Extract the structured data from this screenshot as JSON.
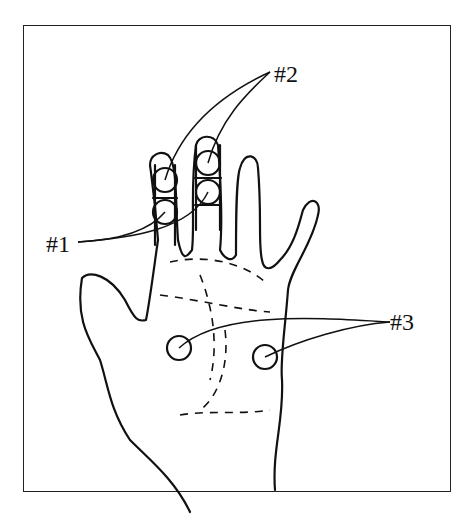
{
  "figure": {
    "type": "hand-diagram",
    "labels": [
      {
        "id": "label-1",
        "text": "#1",
        "x": 46,
        "y": 232
      },
      {
        "id": "label-2",
        "text": "#2",
        "x": 274,
        "y": 62
      },
      {
        "id": "label-3",
        "text": "#3",
        "x": 400,
        "y": 318
      }
    ],
    "colors": {
      "stroke": "#111111",
      "background": "#ffffff"
    }
  }
}
